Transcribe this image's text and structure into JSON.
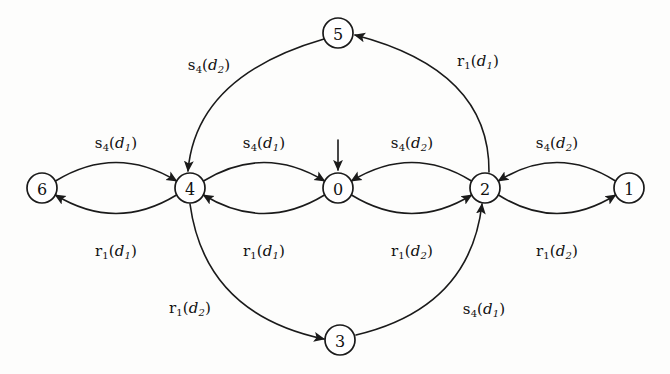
{
  "diagram": {
    "kind": "state-transition-diagram",
    "stroke_color": "#1a1a1a",
    "node_fill": "#ffffff",
    "background": "#fdfdfc",
    "node_radius": 15,
    "initial_state": "0",
    "nodes": [
      {
        "id": "n6",
        "label": "6",
        "cx": 42,
        "cy": 188
      },
      {
        "id": "n4",
        "label": "4",
        "cx": 190,
        "cy": 188
      },
      {
        "id": "n0",
        "label": "0",
        "cx": 338,
        "cy": 188
      },
      {
        "id": "n2",
        "label": "2",
        "cx": 485,
        "cy": 188
      },
      {
        "id": "n1",
        "label": "1",
        "cx": 629,
        "cy": 188
      },
      {
        "id": "n5",
        "label": "5",
        "cx": 338,
        "cy": 33
      },
      {
        "id": "n3",
        "label": "3",
        "cx": 340,
        "cy": 340
      }
    ],
    "edges": [
      {
        "id": "e_6_4",
        "from": "6",
        "to": "4",
        "label": "s4(d1)",
        "label_x": 116,
        "label_y": 143
      },
      {
        "id": "e_4_6",
        "from": "4",
        "to": "6",
        "label": "r1(d1)",
        "label_x": 116,
        "label_y": 251
      },
      {
        "id": "e_4_0",
        "from": "4",
        "to": "0",
        "label": "s4(d1)",
        "label_x": 264,
        "label_y": 143
      },
      {
        "id": "e_0_4",
        "from": "0",
        "to": "4",
        "label": "r1(d1)",
        "label_x": 264,
        "label_y": 251
      },
      {
        "id": "e_2_0",
        "from": "2",
        "to": "0",
        "label": "s4(d2)",
        "label_x": 412,
        "label_y": 143
      },
      {
        "id": "e_0_2",
        "from": "0",
        "to": "2",
        "label": "r1(d2)",
        "label_x": 412,
        "label_y": 251
      },
      {
        "id": "e_1_2",
        "from": "1",
        "to": "2",
        "label": "s4(d2)",
        "label_x": 557,
        "label_y": 143
      },
      {
        "id": "e_2_1",
        "from": "2",
        "to": "1",
        "label": "r1(d2)",
        "label_x": 557,
        "label_y": 251
      },
      {
        "id": "e_5_4",
        "from": "5",
        "to": "4",
        "label": "s4(d2)",
        "label_x": 209,
        "label_y": 65
      },
      {
        "id": "e_2_5",
        "from": "2",
        "to": "5",
        "label": "r1(d1)",
        "label_x": 478,
        "label_y": 61
      },
      {
        "id": "e_4_3",
        "from": "4",
        "to": "3",
        "label": "r1(d2)",
        "label_x": 190,
        "label_y": 308
      },
      {
        "id": "e_3_2",
        "from": "3",
        "to": "2",
        "label": "s4(d1)",
        "label_x": 484,
        "label_y": 309
      }
    ],
    "label_parts": {
      "e_6_4": {
        "op": "s",
        "op_sub": "4",
        "arg": "d",
        "arg_sub": "1"
      },
      "e_4_6": {
        "op": "r",
        "op_sub": "1",
        "arg": "d",
        "arg_sub": "1"
      },
      "e_4_0": {
        "op": "s",
        "op_sub": "4",
        "arg": "d",
        "arg_sub": "1"
      },
      "e_0_4": {
        "op": "r",
        "op_sub": "1",
        "arg": "d",
        "arg_sub": "1"
      },
      "e_2_0": {
        "op": "s",
        "op_sub": "4",
        "arg": "d",
        "arg_sub": "2"
      },
      "e_0_2": {
        "op": "r",
        "op_sub": "1",
        "arg": "d",
        "arg_sub": "2"
      },
      "e_1_2": {
        "op": "s",
        "op_sub": "4",
        "arg": "d",
        "arg_sub": "2"
      },
      "e_2_1": {
        "op": "r",
        "op_sub": "1",
        "arg": "d",
        "arg_sub": "2"
      },
      "e_5_4": {
        "op": "s",
        "op_sub": "4",
        "arg": "d",
        "arg_sub": "2"
      },
      "e_2_5": {
        "op": "r",
        "op_sub": "1",
        "arg": "d",
        "arg_sub": "1"
      },
      "e_4_3": {
        "op": "r",
        "op_sub": "1",
        "arg": "d",
        "arg_sub": "2"
      },
      "e_3_2": {
        "op": "s",
        "op_sub": "4",
        "arg": "d",
        "arg_sub": "1"
      }
    }
  }
}
